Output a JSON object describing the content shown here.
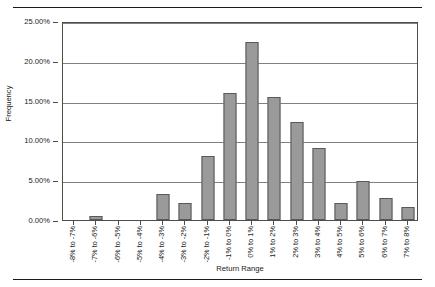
{
  "chart_data": {
    "type": "bar",
    "title": "",
    "xlabel": "Return Range",
    "ylabel": "Frequency",
    "ylim": [
      0,
      25
    ],
    "y_tick_labels": [
      "0.00%",
      "5.00%",
      "10.00%",
      "15.00%",
      "20.00%",
      "25.00%"
    ],
    "y_tick_values": [
      0,
      5,
      10,
      15,
      20,
      25
    ],
    "grid": "horizontal",
    "legend": "none",
    "bar_color": "#9a9a9a",
    "bar_border_color": "#595959",
    "categories": [
      "-8% to -7%",
      "-7% to -6%",
      "-6% to -5%",
      "-5% to -4%",
      "-4% to -3%",
      "-3% to -2%",
      "-2% to -1%",
      "-1% to 0%",
      "0% to 1%",
      "1% to 2%",
      "2% to 3%",
      "3% to 4%",
      "4% to 5%",
      "5% to 6%",
      "6% to 7%",
      "7% to 8%"
    ],
    "values": [
      0,
      0.55,
      0,
      0,
      3.3,
      2.2,
      8.0,
      16.0,
      22.4,
      15.5,
      12.3,
      9.1,
      2.2,
      4.9,
      2.75,
      1.65
    ],
    "value_labels": [
      "0.00%",
      "0.55%",
      "0.00%",
      "0.00%",
      "3.30%",
      "2.20%",
      "8.00%",
      "16.00%",
      "22.40%",
      "15.50%",
      "12.30%",
      "9.10%",
      "2.20%",
      "4.90%",
      "2.75%",
      "1.65%"
    ]
  }
}
